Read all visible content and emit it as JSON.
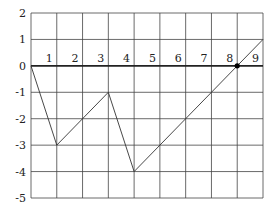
{
  "chart_data": {
    "type": "line",
    "title": "",
    "xlabel": "",
    "ylabel": "",
    "xlim": [
      0,
      9
    ],
    "ylim": [
      -5,
      2
    ],
    "grid": true,
    "x_ticks": [
      "1",
      "2",
      "3",
      "4",
      "5",
      "6",
      "7",
      "8",
      "9"
    ],
    "y_ticks": [
      "2",
      "1",
      "0",
      "-1",
      "-2",
      "-3",
      "-4",
      "-5"
    ],
    "series": [
      {
        "name": "piecewise",
        "points": [
          [
            0,
            0
          ],
          [
            1,
            -3
          ],
          [
            3,
            -1
          ],
          [
            4,
            -4
          ],
          [
            9,
            1
          ]
        ]
      }
    ],
    "annotations": [
      {
        "type": "point",
        "x": 8,
        "y": 0
      }
    ],
    "colors": {
      "line": "#333333",
      "grid": "#444444",
      "axis": "#222222"
    }
  }
}
